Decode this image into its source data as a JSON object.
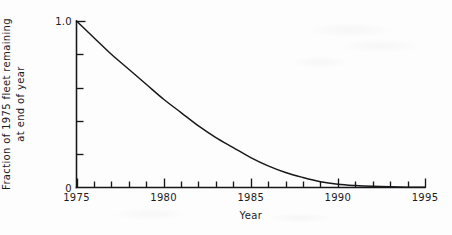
{
  "figure": {
    "background_color": "#fdfdfd",
    "ink_color": "#17171a"
  },
  "chart_data": {
    "type": "line",
    "title": "",
    "xlabel": "Year",
    "ylabel": "Fraction of 1975 fleet remaining at end of year",
    "ylabel_line1": "Fraction of 1975 fleet remaining",
    "ylabel_line2": "at end of year",
    "xlim": [
      1975,
      1995
    ],
    "ylim": [
      0,
      1.0
    ],
    "grid": false,
    "legend": null,
    "x_major_ticks": [
      1975,
      1980,
      1985,
      1990,
      1995
    ],
    "x_major_tick_labels": [
      "1975",
      "1980",
      "1985",
      "1990",
      "1995"
    ],
    "x_minor_tick_interval": 1,
    "y_major_ticks": [
      0,
      1.0
    ],
    "y_major_tick_labels": [
      "0",
      "1.0"
    ],
    "y_minor_ticks": [
      0.2,
      0.4,
      0.6,
      0.8
    ],
    "series": [
      {
        "name": "Fraction of 1975 fleet remaining",
        "x": [
          1975,
          1976,
          1977,
          1978,
          1979,
          1980,
          1981,
          1982,
          1983,
          1984,
          1985,
          1986,
          1987,
          1988,
          1989,
          1990,
          1991,
          1992,
          1993,
          1994,
          1995
        ],
        "values": [
          1.0,
          0.9,
          0.8,
          0.71,
          0.62,
          0.53,
          0.45,
          0.37,
          0.3,
          0.24,
          0.18,
          0.13,
          0.09,
          0.06,
          0.035,
          0.02,
          0.012,
          0.007,
          0.004,
          0.002,
          0.001
        ]
      }
    ]
  },
  "axis_labels": {
    "x": [
      "1975",
      "1980",
      "1985",
      "1990",
      "1995"
    ],
    "y_top": "1.0",
    "y_bottom": "0"
  },
  "titles": {
    "x_axis": "Year",
    "y_axis_line1": "Fraction of 1975 fleet remaining",
    "y_axis_line2": "at end of year"
  }
}
